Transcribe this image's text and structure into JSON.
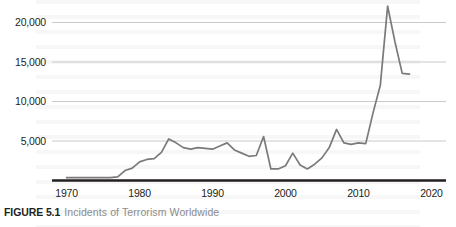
{
  "caption": {
    "figure_number": "FIGURE 5.1",
    "title": "Incidents of Terrorism Worldwide",
    "number_color": "#231f20",
    "title_color": "#8c8c8c"
  },
  "chart_data": {
    "type": "line",
    "title": "Incidents of Terrorism Worldwide",
    "xlabel": "",
    "ylabel": "",
    "xlim": [
      1968,
      2022
    ],
    "ylim": [
      0,
      23000
    ],
    "xticks": [
      1970,
      1980,
      1990,
      2000,
      2010,
      2020
    ],
    "xtick_labels": [
      "1970",
      "1980",
      "1990",
      "2000",
      "2010",
      "2020"
    ],
    "yticks": [
      5000,
      10000,
      15000,
      20000
    ],
    "ytick_labels": [
      "5,000",
      "10,000",
      "15,000",
      "20,000"
    ],
    "grid": "horizontal",
    "legend": "none",
    "line_color": "#7a7a7a",
    "axis_color": "#231f20",
    "grid_color": "#c9c9c9",
    "series": [
      {
        "name": "Incidents of terrorism worldwide",
        "x": [
          1970,
          1971,
          1972,
          1973,
          1974,
          1975,
          1976,
          1977,
          1978,
          1979,
          1980,
          1981,
          1982,
          1983,
          1984,
          1985,
          1986,
          1987,
          1988,
          1989,
          1990,
          1991,
          1992,
          1993,
          1994,
          1995,
          1996,
          1997,
          1998,
          1999,
          2000,
          2001,
          2002,
          2003,
          2004,
          2005,
          2006,
          2007,
          2008,
          2009,
          2010,
          2011,
          2012,
          2013,
          2014,
          2015,
          2016,
          2017
        ],
        "values": [
          300,
          300,
          300,
          300,
          300,
          300,
          300,
          400,
          1200,
          1500,
          2300,
          2600,
          2700,
          3500,
          5200,
          4700,
          4100,
          3900,
          4100,
          4000,
          3900,
          4300,
          4700,
          3800,
          3400,
          3000,
          3100,
          5500,
          1400,
          1400,
          1800,
          3400,
          1900,
          1400,
          2000,
          2800,
          4100,
          6400,
          4700,
          4500,
          4700,
          4600,
          8500,
          12000,
          22000,
          17500,
          13500,
          13400
        ]
      }
    ]
  }
}
